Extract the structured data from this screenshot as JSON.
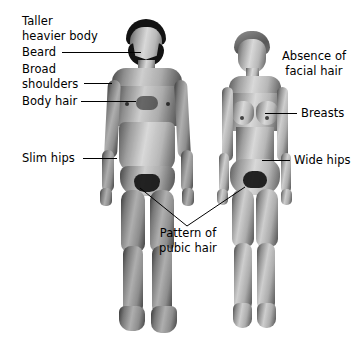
{
  "figure": {
    "title_alt": "Comparison of adult male and female secondary sexual characteristics",
    "subjects": [
      {
        "name": "male-figure",
        "side": "left"
      },
      {
        "name": "female-figure",
        "side": "right"
      }
    ],
    "background_color": "#ffffff",
    "line_color": "#000000",
    "text_color": "#000000"
  },
  "labels": {
    "taller_heavier": "Taller\nheavier body",
    "beard": "Beard",
    "broad_shoulders": "Broad\nshoulders",
    "body_hair": "Body hair",
    "slim_hips": "Slim hips",
    "absence_facial_hair": "Absence of\nfacial hair",
    "breasts": "Breasts",
    "wide_hips": "Wide hips",
    "pubic_hair": "Pattern of\npubic hair"
  }
}
